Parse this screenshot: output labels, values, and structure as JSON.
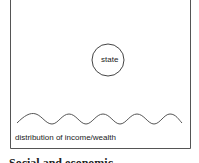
{
  "diagram": {
    "circle_label": "state",
    "base_label": "distribution of income/wealth",
    "caption_partial": "Social and economic"
  },
  "colors": {
    "stroke": "#555555",
    "text": "#222222"
  }
}
